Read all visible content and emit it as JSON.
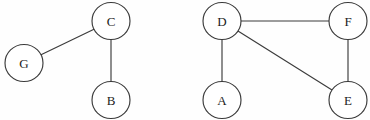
{
  "diagram": {
    "background_color": "#fefefe",
    "stroke_color": "#3b3b3b",
    "node_fill_color": "#ffffff",
    "label_color": "#1c1c1c",
    "width": 370,
    "height": 120
  },
  "chart_data": {
    "type": "diagram",
    "graph_type": "undirected",
    "components": 2,
    "nodes": [
      {
        "id": "G",
        "label": "G",
        "cx": 24,
        "cy": 63,
        "rx": 19,
        "ry": 18.5,
        "component": 1
      },
      {
        "id": "C",
        "label": "C",
        "cx": 111,
        "cy": 21,
        "rx": 19,
        "ry": 18.5,
        "component": 1
      },
      {
        "id": "B",
        "label": "B",
        "cx": 111,
        "cy": 100,
        "rx": 19,
        "ry": 18.5,
        "component": 1
      },
      {
        "id": "D",
        "label": "D",
        "cx": 222,
        "cy": 21,
        "rx": 19,
        "ry": 18.5,
        "component": 2
      },
      {
        "id": "F",
        "label": "F",
        "cx": 348,
        "cy": 21,
        "rx": 19,
        "ry": 18.5,
        "component": 2
      },
      {
        "id": "A",
        "label": "A",
        "cx": 222,
        "cy": 100,
        "rx": 19,
        "ry": 18.5,
        "component": 2
      },
      {
        "id": "E",
        "label": "E",
        "cx": 348,
        "cy": 100,
        "rx": 19,
        "ry": 18.5,
        "component": 2
      }
    ],
    "edges": [
      {
        "source": "G",
        "target": "C",
        "component": 1
      },
      {
        "source": "C",
        "target": "B",
        "component": 1
      },
      {
        "source": "D",
        "target": "F",
        "component": 2
      },
      {
        "source": "D",
        "target": "A",
        "component": 2
      },
      {
        "source": "D",
        "target": "E",
        "component": 2
      },
      {
        "source": "F",
        "target": "E",
        "component": 2
      }
    ],
    "node_count": 7,
    "edge_count": 6,
    "degrees": {
      "G": 1,
      "C": 2,
      "B": 1,
      "D": 3,
      "F": 2,
      "A": 1,
      "E": 2
    }
  }
}
